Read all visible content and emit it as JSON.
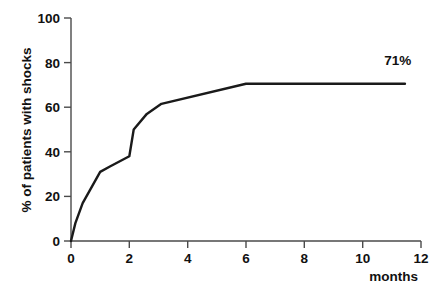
{
  "chart_data": {
    "type": "line",
    "title": "",
    "subtitle": "",
    "xlabel": "months",
    "ylabel": "% of patients with shocks",
    "xlim": [
      0,
      12
    ],
    "ylim": [
      0,
      100
    ],
    "grid": false,
    "legend": null,
    "xticks": [
      0,
      2,
      4,
      6,
      8,
      10,
      12
    ],
    "xtick_labels": [
      "0",
      "2",
      "4",
      "6",
      "8",
      "10",
      "12"
    ],
    "yticks": [
      0,
      20,
      40,
      60,
      80,
      100
    ],
    "ytick_labels": [
      "0",
      "20",
      "40",
      "60",
      "80",
      "100"
    ],
    "series": [
      {
        "name": "cumulative shocks",
        "x": [
          0.0,
          0.15,
          0.4,
          1.0,
          1.35,
          2.0,
          2.15,
          2.6,
          3.1,
          6.0,
          11.45
        ],
        "y": [
          0.0,
          8.0,
          17.0,
          31.0,
          33.5,
          38.0,
          50.0,
          57.0,
          61.5,
          70.5,
          70.5
        ]
      }
    ],
    "annotations": [
      {
        "name": "plateau-value",
        "text": "71%",
        "x": 11.2,
        "y": 79.0
      }
    ]
  },
  "axis": {
    "x_title": "months",
    "y_title": "% of patients with shocks",
    "x_tick_0": "0",
    "x_tick_2": "2",
    "x_tick_4": "4",
    "x_tick_6": "6",
    "x_tick_8": "8",
    "x_tick_10": "10",
    "x_tick_12": "12",
    "y_tick_0": "0",
    "y_tick_20": "20",
    "y_tick_40": "40",
    "y_tick_60": "60",
    "y_tick_80": "80",
    "y_tick_100": "100"
  },
  "colors": {
    "background": "#ffffff",
    "axis": "#4a4a4a",
    "line": "#1a1a1a",
    "text": "#111111"
  }
}
